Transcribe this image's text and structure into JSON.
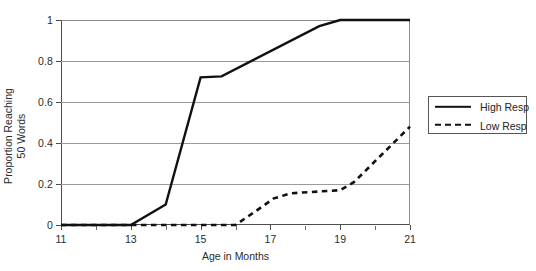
{
  "chart_data": {
    "type": "line",
    "title": "",
    "xlabel": "Age in Months",
    "ylabel": "Proportion Reaching\n50 Words",
    "xlim": [
      11,
      21
    ],
    "ylim": [
      0,
      1
    ],
    "grid": true,
    "legend_position": "right-outside",
    "x_ticks": [
      11,
      13,
      15,
      17,
      19,
      21
    ],
    "x_tick_labels": [
      "11",
      "13",
      "15",
      "17",
      "19",
      "21"
    ],
    "x_minor_ticks": [
      12,
      14,
      16,
      18,
      20
    ],
    "y_ticks": [
      0,
      0.2,
      0.4,
      0.6,
      0.8,
      1
    ],
    "y_tick_labels": [
      "0",
      "0.2",
      "0.4",
      "0.6",
      "0.8",
      "1"
    ],
    "series": [
      {
        "name": "High Resp",
        "style": "solid",
        "color": "#111111",
        "x": [
          11,
          13,
          14,
          15,
          15.6,
          18.4,
          19,
          21
        ],
        "values": [
          0,
          0,
          0.1,
          0.72,
          0.725,
          0.97,
          1,
          1
        ]
      },
      {
        "name": "Low Resp",
        "style": "dashed",
        "color": "#111111",
        "x": [
          11,
          16,
          16.6,
          17.1,
          17.6,
          19,
          19.4,
          21
        ],
        "values": [
          0,
          0,
          0.07,
          0.13,
          0.155,
          0.17,
          0.21,
          0.48
        ]
      }
    ]
  },
  "legend": {
    "items": [
      {
        "label": "High Resp",
        "swatch": "solid-line-swatch"
      },
      {
        "label": "Low Resp",
        "swatch": "dashed-line-swatch"
      }
    ]
  }
}
